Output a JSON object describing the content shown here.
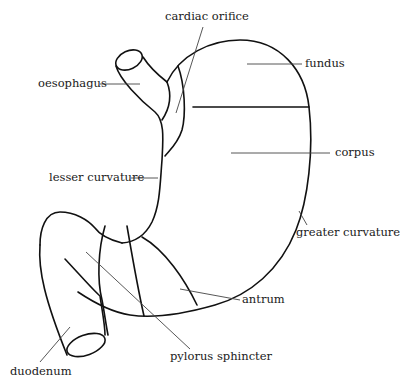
{
  "diagram": {
    "labels": {
      "cardiac_orifice": "cardiac orifice",
      "fundus": "fundus",
      "oesophagus": "oesophagus",
      "corpus": "corpus",
      "lesser_curvature": "lesser curvature",
      "greater_curvature": "greater curvature",
      "antrum": "antrum",
      "pylorus_sphincter": "pylorus sphincter",
      "duodenum": "duodenum"
    },
    "colors": {
      "outline": "#111111",
      "leader": "#444444",
      "text": "#1a1a1a",
      "background": "#ffffff"
    }
  }
}
